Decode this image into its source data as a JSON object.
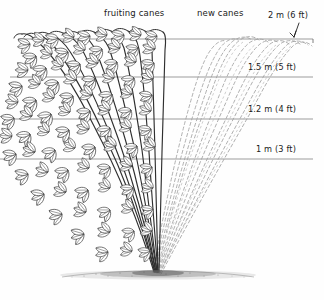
{
  "figure": {
    "background_color": "#fefefe",
    "ink_color": "#2b2b2b",
    "wire_color": "#6f6f6f",
    "new_cane_color": "#9a9a9a",
    "width": 324,
    "height": 300
  },
  "labels": {
    "fruiting_canes": "fruiting canes",
    "new_canes": "new canes",
    "height_top": "2 m (6 ft)",
    "height_second": "1.5 m (5 ft)",
    "height_third": "1.2 m (4 ft)",
    "height_fourth": "1 m (3 ft)"
  },
  "wires": [
    {
      "label": "2 m (6 ft)",
      "y": 39,
      "metric": "2 m",
      "imperial": "6 ft"
    },
    {
      "label": "1.5 m (5 ft)",
      "y": 77,
      "metric": "1.5 m",
      "imperial": "5 ft"
    },
    {
      "label": "1.2 m (4 ft)",
      "y": 119,
      "metric": "1.2 m",
      "imperial": "4 ft"
    },
    {
      "label": "1 m (3 ft)",
      "y": 159,
      "metric": "1 m",
      "imperial": "3 ft"
    }
  ],
  "icons": {
    "arrow": "down-arrow-icon",
    "ground": "soil-line-icon"
  }
}
